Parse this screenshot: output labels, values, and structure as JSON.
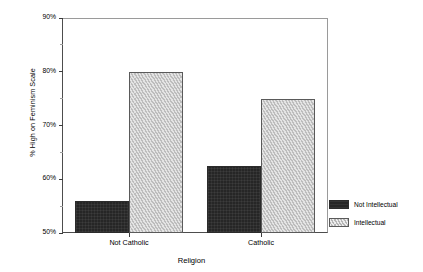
{
  "chart_data": {
    "type": "bar",
    "title": "",
    "xlabel": "Religion",
    "ylabel": "% High on Feminism Scale",
    "categories": [
      "Not Catholic",
      "Catholic"
    ],
    "series": [
      {
        "name": "Not Intellectual",
        "values": [
          56,
          62.5
        ],
        "color": "#262626",
        "pattern": "solid-dark"
      },
      {
        "name": "Intellectual",
        "values": [
          80,
          75
        ],
        "color": "#c8c8c8",
        "pattern": "zigzag-light"
      }
    ],
    "ylim": [
      50,
      90
    ],
    "ytick_labels": [
      "50%",
      "60%",
      "70%",
      "80%",
      "90%"
    ],
    "ytick_values": [
      50,
      60,
      70,
      80,
      90
    ],
    "yminor_values": [
      55,
      65,
      75,
      85
    ],
    "grid": false,
    "legend_position": "right"
  },
  "legend": {
    "entries": [
      {
        "label": "Not Intellectual"
      },
      {
        "label": "Intellectual"
      }
    ]
  }
}
